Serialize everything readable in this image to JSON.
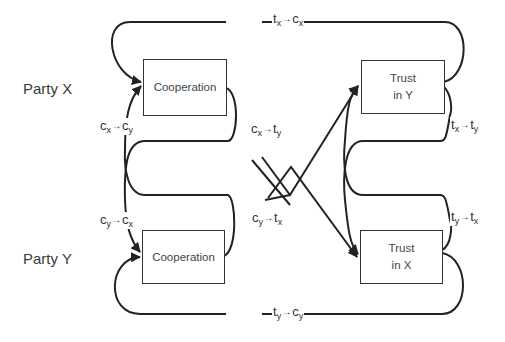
{
  "parties": {
    "x": {
      "label": "Party X"
    },
    "y": {
      "label": "Party Y"
    }
  },
  "boxes": {
    "coop_x": {
      "label": "Cooperation"
    },
    "trust_y": {
      "line1": "Trust",
      "line2": "in Y"
    },
    "coop_y": {
      "label": "Cooperation"
    },
    "trust_x": {
      "line1": "Trust",
      "line2": "in X"
    }
  },
  "edges": {
    "tx_cx": {
      "from": "t",
      "from_sub": "x",
      "arrow": "→",
      "to": "c",
      "to_sub": "x"
    },
    "ty_cy": {
      "from": "t",
      "from_sub": "y",
      "arrow": "→",
      "to": "c",
      "to_sub": "y"
    },
    "cx_cy": {
      "from": "c",
      "from_sub": "x",
      "arrow": "→",
      "to": "c",
      "to_sub": "y"
    },
    "cy_cx": {
      "from": "c",
      "from_sub": "y",
      "arrow": "→",
      "to": "c",
      "to_sub": "x"
    },
    "cx_ty": {
      "from": "c",
      "from_sub": "x",
      "arrow": "→",
      "to": "t",
      "to_sub": "y"
    },
    "cy_tx": {
      "from": "c",
      "from_sub": "y",
      "arrow": "→",
      "to": "t",
      "to_sub": "x"
    },
    "tx_ty": {
      "from": "t",
      "from_sub": "x",
      "arrow": "→",
      "to": "t",
      "to_sub": "y"
    },
    "ty_tx": {
      "from": "t",
      "from_sub": "y",
      "arrow": "→",
      "to": "t",
      "to_sub": "x"
    }
  },
  "colors": {
    "line": "#222222",
    "text": "#3a3a3a"
  }
}
